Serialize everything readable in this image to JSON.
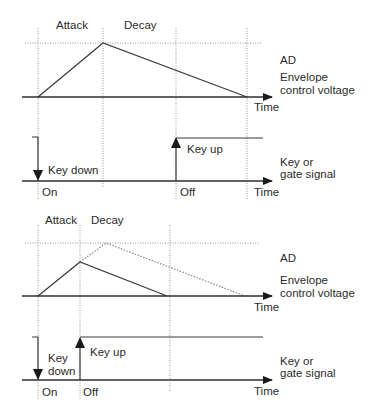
{
  "colors": {
    "line": "#3a3a3a",
    "axis": "#2e2e2e",
    "grid": "#8a8a8a",
    "text": "#2b2b2b",
    "background": "#ffffff"
  },
  "top_panel": {
    "envelope": {
      "phase_labels": {
        "attack": "Attack",
        "decay": "Decay"
      },
      "title": "AD",
      "subtitle_line1": "Envelope",
      "subtitle_line2": "control voltage",
      "axis_label": "Time"
    },
    "gate": {
      "key_down_label": "Key down",
      "key_up_label": "Key up",
      "on_label": "On",
      "off_label": "Off",
      "axis_label": "Time",
      "title_line1": "Key or",
      "title_line2": "gate signal"
    }
  },
  "bottom_panel": {
    "envelope": {
      "phase_labels": {
        "attack": "Attack",
        "decay": "Decay"
      },
      "title": "AD",
      "subtitle_line1": "Envelope",
      "subtitle_line2": "control voltage",
      "axis_label": "Time"
    },
    "gate": {
      "key_down_line1": "Key",
      "key_down_line2": "down",
      "key_up_label": "Key up",
      "on_label": "On",
      "off_label": "Off",
      "axis_label": "Time",
      "title_line1": "Key or",
      "title_line2": "gate signal"
    }
  }
}
